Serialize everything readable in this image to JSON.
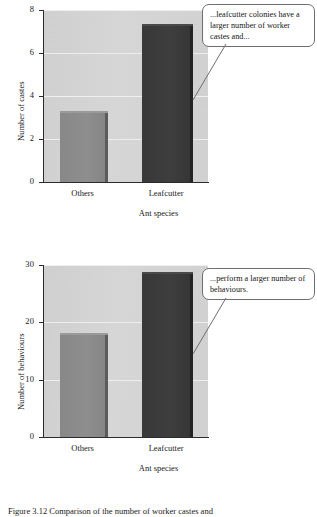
{
  "figure": {
    "caption": "Figure 3.12   Comparison of the number of worker castes and"
  },
  "chart_data": [
    {
      "type": "bar",
      "id": "castes",
      "title": "",
      "categories": [
        "Others",
        "Leafcutter"
      ],
      "values": [
        3.2,
        7.25
      ],
      "xlabel": "Ant species",
      "ylabel": "Number of castes",
      "ylim": [
        0,
        8
      ],
      "yticks": [
        0,
        2,
        4,
        6,
        8
      ],
      "ytick_labels": [
        "0",
        "2",
        "4",
        "6",
        "8"
      ],
      "grid": true,
      "legend": "none",
      "bar_colors": [
        "#8a8a8a",
        "#3a3a3a"
      ],
      "plot_background": "#d2d2d2",
      "annotation": "...leafcutter colonies have a larger number of worker castes and..."
    },
    {
      "type": "bar",
      "id": "behaviours",
      "title": "",
      "categories": [
        "Others",
        "Leafcutter"
      ],
      "values": [
        17.8,
        28.5
      ],
      "xlabel": "Ant species",
      "ylabel": "Number of behaviours",
      "ylim": [
        0,
        30
      ],
      "yticks": [
        0,
        10,
        20,
        30
      ],
      "ytick_labels": [
        "0",
        "10",
        "20",
        "30"
      ],
      "grid": true,
      "legend": "none",
      "bar_colors": [
        "#8a8a8a",
        "#3a3a3a"
      ],
      "plot_background": "#d2d2d2",
      "annotation": "...perform a larger number of behaviours."
    }
  ]
}
